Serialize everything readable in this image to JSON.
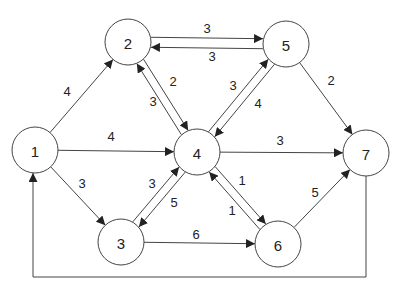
{
  "diagram": {
    "type": "directed-weighted-graph",
    "node_radius": 23,
    "stroke_color": "#444444",
    "nodes": [
      {
        "id": "1",
        "label": "1",
        "x": 35,
        "y": 150
      },
      {
        "id": "2",
        "label": "2",
        "x": 128,
        "y": 42
      },
      {
        "id": "3",
        "label": "3",
        "x": 121,
        "y": 242
      },
      {
        "id": "4",
        "label": "4",
        "x": 197,
        "y": 152
      },
      {
        "id": "5",
        "label": "5",
        "x": 286,
        "y": 44
      },
      {
        "id": "6",
        "label": "6",
        "x": 278,
        "y": 244
      },
      {
        "id": "7",
        "label": "7",
        "x": 366,
        "y": 153
      }
    ],
    "edges": [
      {
        "from": "1",
        "to": "2",
        "weight": "4",
        "offset": 0,
        "label_pos": [
          67,
          91
        ]
      },
      {
        "from": "1",
        "to": "4",
        "weight": "4",
        "offset": 0,
        "label_pos": [
          111,
          136
        ]
      },
      {
        "from": "1",
        "to": "3",
        "weight": "3",
        "offset": 0,
        "label_pos": [
          82,
          183
        ]
      },
      {
        "from": "2",
        "to": "5",
        "weight": "3",
        "offset": -5,
        "label_pos": [
          207,
          28
        ]
      },
      {
        "from": "5",
        "to": "2",
        "weight": "3",
        "offset": -5,
        "label_pos": [
          212,
          56
        ]
      },
      {
        "from": "2",
        "to": "4",
        "weight": "2",
        "offset": -4,
        "label_pos": [
          173,
          81
        ]
      },
      {
        "from": "4",
        "to": "2",
        "weight": "3",
        "offset": -4,
        "label_pos": [
          153,
          101
        ]
      },
      {
        "from": "4",
        "to": "5",
        "weight": "3",
        "offset": -4,
        "label_pos": [
          233,
          85
        ]
      },
      {
        "from": "5",
        "to": "4",
        "weight": "4",
        "offset": -4,
        "label_pos": [
          258,
          103
        ]
      },
      {
        "from": "5",
        "to": "7",
        "weight": "2",
        "offset": 0,
        "label_pos": [
          331,
          80
        ]
      },
      {
        "from": "4",
        "to": "7",
        "weight": "3",
        "offset": 0,
        "label_pos": [
          280,
          140
        ]
      },
      {
        "from": "3",
        "to": "4",
        "weight": "3",
        "offset": -4,
        "label_pos": [
          152,
          183
        ]
      },
      {
        "from": "4",
        "to": "3",
        "weight": "5",
        "offset": -4,
        "label_pos": [
          174,
          202
        ]
      },
      {
        "from": "3",
        "to": "6",
        "weight": "6",
        "offset": 0,
        "label_pos": [
          196,
          234
        ]
      },
      {
        "from": "4",
        "to": "6",
        "weight": "1",
        "offset": -4,
        "label_pos": [
          242,
          180
        ]
      },
      {
        "from": "6",
        "to": "4",
        "weight": "1",
        "offset": -4,
        "label_pos": [
          232,
          210
        ]
      },
      {
        "from": "6",
        "to": "7",
        "weight": "5",
        "offset": 0,
        "label_pos": [
          315,
          192
        ]
      }
    ],
    "loop_edge": {
      "from": "7",
      "to": "1",
      "points": [
        [
          366,
          176
        ],
        [
          366,
          277
        ],
        [
          33,
          277
        ],
        [
          33,
          173
        ]
      ]
    }
  }
}
